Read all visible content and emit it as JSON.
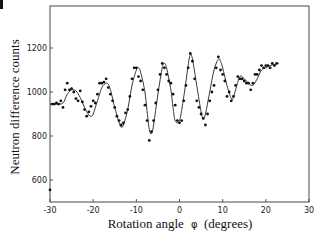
{
  "chart_data": {
    "type": "scatter",
    "title": "",
    "xlabel": "Rotation angle φ (degrees)",
    "ylabel": "Neutron difference counts",
    "xlim": [
      -30,
      30
    ],
    "ylim": [
      500,
      1380
    ],
    "xticks": [
      -30,
      -20,
      -10,
      0,
      10,
      20,
      30
    ],
    "xtick_labels": [
      "-30",
      "-20",
      "-10",
      "0",
      "10",
      "20",
      "30"
    ],
    "yticks": [
      600,
      800,
      1000,
      1200
    ],
    "ytick_labels": [
      "600",
      "800",
      "1000",
      "1200"
    ],
    "grid": false,
    "legend": null,
    "series": [
      {
        "name": "measured points",
        "style": "markers",
        "x": [
          -30,
          -29.5,
          -29,
          -28.5,
          -28,
          -27.5,
          -27,
          -26.5,
          -26,
          -25.5,
          -25,
          -24.5,
          -24,
          -23.5,
          -23,
          -22.5,
          -22,
          -21.5,
          -21,
          -20.5,
          -20,
          -19.5,
          -19,
          -18.5,
          -18,
          -17.5,
          -17,
          -16.5,
          -16,
          -15.5,
          -15,
          -14.5,
          -14,
          -13.5,
          -13,
          -12.5,
          -12,
          -11.5,
          -11,
          -10.5,
          -10,
          -9.5,
          -9,
          -8.5,
          -8,
          -7.5,
          -7,
          -6.5,
          -6,
          -5.5,
          -5,
          -4.5,
          -4,
          -3.5,
          -3,
          -2.5,
          -2,
          -1.5,
          -1,
          -0.5,
          0,
          0.5,
          1,
          1.5,
          2,
          2.5,
          3,
          3.5,
          4,
          4.5,
          5,
          5.5,
          6,
          6.5,
          7,
          7.5,
          8,
          8.5,
          9,
          9.5,
          10,
          10.5,
          11,
          11.5,
          12,
          12.5,
          13,
          13.5,
          14,
          14.5,
          15,
          15.5,
          16,
          16.5,
          17,
          17.5,
          18,
          18.5,
          19,
          19.5,
          20,
          20.5,
          21,
          21.5,
          22,
          22.5
        ],
        "y": [
          555,
          945,
          945,
          950,
          945,
          960,
          930,
          1010,
          1040,
          1010,
          1015,
          1000,
          970,
          960,
          1005,
          955,
          920,
          890,
          910,
          935,
          960,
          950,
          990,
          1040,
          1040,
          1045,
          1060,
          1020,
          990,
          960,
          930,
          890,
          870,
          850,
          860,
          905,
          920,
          980,
          1060,
          1110,
          1110,
          1070,
          1050,
          1010,
          940,
          870,
          780,
          820,
          870,
          950,
          1010,
          1080,
          1130,
          1110,
          1080,
          1050,
          1040,
          990,
          940,
          870,
          860,
          870,
          960,
          1030,
          1110,
          1175,
          1140,
          1060,
          960,
          930,
          900,
          880,
          850,
          900,
          960,
          1000,
          1030,
          1110,
          1160,
          1100,
          1080,
          1050,
          980,
          1000,
          960,
          980,
          1030,
          1070,
          1060,
          1060,
          1050,
          1040,
          1040,
          1010,
          1040,
          1080,
          1080,
          1100,
          1120,
          1110,
          1120,
          1120,
          1110,
          1130,
          1120,
          1130
        ]
      },
      {
        "name": "fitted curve",
        "style": "line",
        "x": [
          -30,
          -28.5,
          -27,
          -26,
          -25,
          -24,
          -23,
          -22,
          -21,
          -20.5,
          -20,
          -19,
          -18,
          -17,
          -16.5,
          -16,
          -15,
          -14,
          -13.5,
          -13,
          -12,
          -11,
          -10,
          -9.5,
          -9,
          -8,
          -7.5,
          -7,
          -6.5,
          -6,
          -5,
          -4,
          -3.5,
          -3,
          -2,
          -1.5,
          -1,
          0,
          1,
          2,
          2.5,
          3,
          4,
          5,
          5.5,
          6,
          7,
          8,
          9,
          9.5,
          10,
          11,
          12,
          12.5,
          13,
          14,
          15,
          16,
          17,
          18,
          19,
          20,
          21,
          22,
          23
        ],
        "y": [
          945,
          945,
          950,
          990,
          1010,
          1005,
          975,
          930,
          895,
          890,
          900,
          960,
          1020,
          1040,
          1035,
          1010,
          930,
          860,
          840,
          850,
          920,
          1030,
          1100,
          1110,
          1090,
          1000,
          910,
          830,
          810,
          850,
          990,
          1110,
          1130,
          1110,
          1010,
          930,
          870,
          870,
          980,
          1120,
          1170,
          1150,
          1030,
          910,
          880,
          900,
          1000,
          1100,
          1150,
          1140,
          1110,
          1030,
          970,
          975,
          1010,
          1070,
          1060,
          1040,
          1030,
          1060,
          1100,
          1110,
          1120,
          1125,
          1130
        ]
      }
    ]
  },
  "axes": {
    "xlabel_text": "Rotation angle",
    "xlabel_symbol": "φ",
    "xlabel_units": "(degrees)",
    "ylabel_text": "Neutron difference counts"
  }
}
